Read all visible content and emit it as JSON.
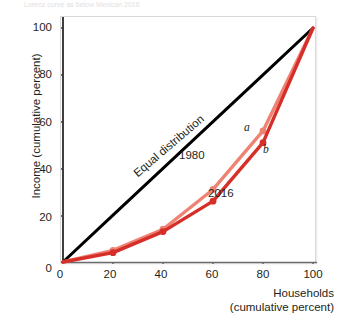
{
  "figure": {
    "caption_top": "Lorenz curve as below Mexican 2016",
    "background_color": "#ffffff"
  },
  "chart_data": {
    "type": "line",
    "title": "",
    "xlabel": "Households (cumulative percent)",
    "ylabel": "Income (cumulative percent)",
    "xlim": [
      0,
      100
    ],
    "ylim": [
      0,
      100
    ],
    "xticks": [
      0,
      20,
      40,
      60,
      80,
      100
    ],
    "yticks": [
      0,
      20,
      40,
      60,
      80,
      100
    ],
    "grid": false,
    "legend_position": "inline-annotation",
    "x": [
      0,
      20,
      40,
      60,
      80,
      100
    ],
    "series": [
      {
        "name": "Equal distribution",
        "label": "Equal distribution",
        "color": "#000000",
        "values": [
          0,
          20,
          40,
          60,
          80,
          100
        ],
        "markers": false,
        "width": 3
      },
      {
        "name": "1980",
        "label": "1980",
        "color": "#EE8374",
        "values": [
          0,
          5,
          14,
          31,
          56,
          100
        ],
        "markers": true,
        "width": 3.4
      },
      {
        "name": "2016",
        "label": "2016",
        "color": "#D62E28",
        "values": [
          0,
          4,
          13,
          26,
          51,
          100
        ],
        "markers": true,
        "width": 3.4
      }
    ],
    "annotations": [
      {
        "text": "a",
        "x": 80,
        "y": 56,
        "series": "1980",
        "style": "italic"
      },
      {
        "text": "b",
        "x": 80,
        "y": 51,
        "series": "2016",
        "style": "italic"
      },
      {
        "text": "1980",
        "x": 55,
        "y": 63,
        "series": "1980",
        "style": "plain"
      },
      {
        "text": "2016",
        "x": 66,
        "y": 35,
        "series": "2016",
        "style": "plain"
      },
      {
        "text": "Equal distribution",
        "x": 28,
        "y": 30,
        "series": "Equal distribution",
        "style": "rotated"
      }
    ]
  }
}
